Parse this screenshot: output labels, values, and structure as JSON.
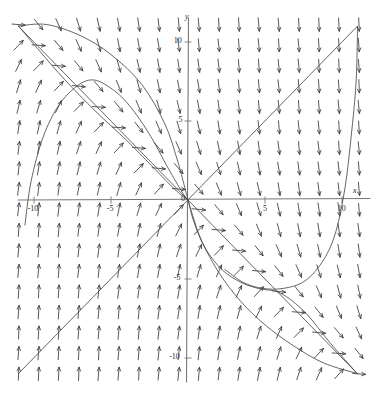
{
  "figure": {
    "kind": "direction-field",
    "background": "#ffffff",
    "ink": "#3a3a3a",
    "axis_color": "#777777",
    "curve_color": "#4a4a4a"
  },
  "axis_labels": {
    "x_axis_name": "x",
    "y_axis_name": "y",
    "origin": "0"
  },
  "x_ticks": [
    {
      "value": -10,
      "label": "-10"
    },
    {
      "value": -5,
      "label": "-5"
    },
    {
      "value": 5,
      "label": "5"
    },
    {
      "value": 10,
      "label": "10"
    }
  ],
  "y_ticks": [
    {
      "value": 10,
      "label": "10"
    },
    {
      "value": 5,
      "label": "5"
    },
    {
      "value": -5,
      "label": "-5"
    },
    {
      "value": -10,
      "label": "-10"
    }
  ],
  "chart_data": {
    "type": "scatter",
    "title": "",
    "xlabel": "x",
    "ylabel": "y",
    "xlim": [
      -12,
      12.5
    ],
    "ylim": [
      -12,
      12
    ],
    "grid": false,
    "legend": "none",
    "field": {
      "description": "direction field of arrows on a regular grid",
      "x_start": -11,
      "x_end": 11.5,
      "x_step": 1.3,
      "y_start": -11,
      "y_end": 11.5,
      "y_step": 1.3,
      "arrow_length_px": 13,
      "rule": "angle = atan2(-(x+y), 1) style rotation; arrows point up-left of the line y=-x and down-right of it"
    },
    "solution_curves": [
      {
        "name": "line-y-equals-x",
        "shape": "line",
        "points": [
          [
            -11,
            -11
          ],
          [
            11,
            11
          ]
        ]
      },
      {
        "name": "line-y-equals-minus-x",
        "shape": "line",
        "points": [
          [
            -11,
            11
          ],
          [
            11,
            -11
          ]
        ]
      },
      {
        "name": "upper-left-arc-outer",
        "shape": "curve",
        "points": [
          [
            -11,
            11
          ],
          [
            -9.2,
            11.1
          ],
          [
            -7,
            10.4
          ],
          [
            -5,
            9.2
          ],
          [
            -3,
            7.3
          ],
          [
            -1.5,
            4.8
          ],
          [
            -0.7,
            2.6
          ],
          [
            -0.2,
            0.8
          ],
          [
            0,
            0
          ]
        ]
      },
      {
        "name": "upper-left-arc-inner",
        "shape": "curve",
        "points": [
          [
            -11,
            11
          ],
          [
            -9.6,
            9.4
          ],
          [
            -8,
            7.6
          ],
          [
            -6,
            5.6
          ],
          [
            -4,
            3.8
          ],
          [
            -2.4,
            2.2
          ],
          [
            -1.1,
            0.9
          ],
          [
            -0.3,
            0.2
          ],
          [
            0,
            0
          ]
        ]
      },
      {
        "name": "left-hump-curve",
        "shape": "curve",
        "points": [
          [
            -10.6,
            -1.6
          ],
          [
            -10.2,
            1.2
          ],
          [
            -9.4,
            4.0
          ],
          [
            -8.4,
            6.0
          ],
          [
            -7.2,
            7.2
          ],
          [
            -6.2,
            7.6
          ],
          [
            -5.2,
            7.2
          ],
          [
            -4.0,
            6.2
          ],
          [
            -2.6,
            4.3
          ],
          [
            -1.3,
            2.0
          ],
          [
            -0.4,
            0.5
          ],
          [
            0,
            0
          ]
        ]
      },
      {
        "name": "lower-right-arc-outer",
        "shape": "curve",
        "points": [
          [
            0,
            0
          ],
          [
            0.3,
            -1.0
          ],
          [
            0.9,
            -2.6
          ],
          [
            2.0,
            -4.6
          ],
          [
            3.4,
            -6.4
          ],
          [
            5.0,
            -7.9
          ],
          [
            6.8,
            -9.2
          ],
          [
            8.8,
            -10.3
          ],
          [
            11,
            -11
          ]
        ]
      },
      {
        "name": "lower-right-arc-inner",
        "shape": "curve",
        "points": [
          [
            0,
            0
          ],
          [
            0.4,
            -1.4
          ],
          [
            1.1,
            -3.0
          ],
          [
            2.2,
            -4.4
          ],
          [
            3.4,
            -5.2
          ],
          [
            4.6,
            -5.6
          ],
          [
            6.0,
            -5.9
          ],
          [
            7.6,
            -7.1
          ],
          [
            9.2,
            -9.0
          ],
          [
            11,
            -11
          ]
        ]
      },
      {
        "name": "right-dip-curve",
        "shape": "curve",
        "points": [
          [
            2.4,
            -4.4
          ],
          [
            3.6,
            -5.2
          ],
          [
            4.8,
            -5.6
          ],
          [
            6.2,
            -5.6
          ],
          [
            7.6,
            -5.1
          ],
          [
            8.8,
            -3.8
          ],
          [
            9.6,
            -2.0
          ],
          [
            10.2,
            0.8
          ],
          [
            10.6,
            4.0
          ],
          [
            10.9,
            7.4
          ],
          [
            11,
            11
          ]
        ]
      }
    ]
  }
}
